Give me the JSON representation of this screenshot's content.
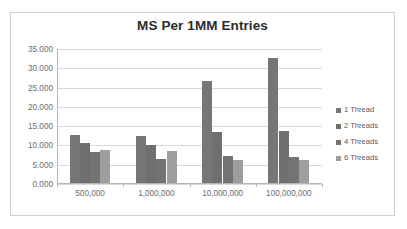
{
  "chart_data": {
    "type": "bar",
    "title": "MS Per 1MM Entries",
    "xlabel": "",
    "ylabel": "",
    "categories": [
      "500,000",
      "1,000,000",
      "10,000,000",
      "100,000,000"
    ],
    "series": [
      {
        "name": "1 Thread",
        "values": [
          12.5,
          12.3,
          26.5,
          32.5
        ],
        "color": "#767676"
      },
      {
        "name": "2 Threads",
        "values": [
          10.3,
          9.9,
          13.1,
          13.6
        ],
        "color": "#6f6f6f"
      },
      {
        "name": "4 Threads",
        "values": [
          8.1,
          6.3,
          7.1,
          6.7
        ],
        "color": "#737373"
      },
      {
        "name": "6 Threads",
        "values": [
          8.5,
          8.3,
          6.0,
          5.9
        ],
        "color": "#9e9e9e"
      }
    ],
    "ylim": [
      0,
      35
    ],
    "y_ticks": [
      0,
      5,
      10,
      15,
      20,
      25,
      30,
      35
    ],
    "y_tick_labels": [
      "0.000",
      "5.000",
      "10.000",
      "15.000",
      "20.000",
      "25.000",
      "30.000",
      "35.000"
    ],
    "grid": true,
    "legend_position": "right",
    "plot_background": "#ffffff",
    "gridline_color": "#d9d9d9",
    "axis_color": "#b5b5b5",
    "tick_label_color": "#6d6d6d",
    "title_color": "#2b2b2b",
    "border_color": "#d0d0d0"
  }
}
